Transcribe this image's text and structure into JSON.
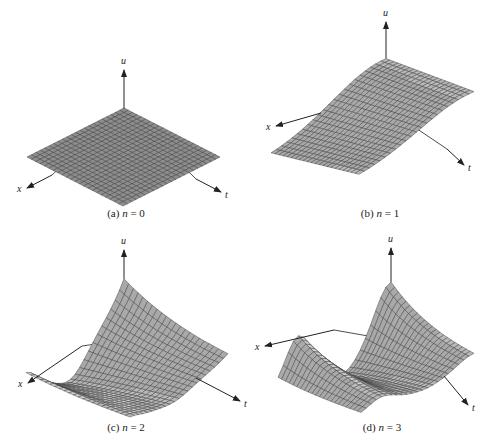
{
  "figure": {
    "panels": [
      {
        "id": "a",
        "caption_prefix": "(a)",
        "caption_var": "n",
        "caption_eq": " = 0",
        "n": 0,
        "axis_labels": {
          "u": "u",
          "x": "x",
          "t": "t"
        },
        "origin": [
          124,
          108
        ],
        "u_tip": [
          124,
          68
        ],
        "x_dir": [
          -97,
          49
        ],
        "t_dir": [
          96,
          49
        ],
        "x_arrow": [
          [
            52,
            175
          ],
          [
            27,
            188
          ]
        ],
        "t_arrow": [
          [
            196,
            179
          ],
          [
            221,
            192
          ]
        ],
        "u_scale": 0,
        "caption_pos": [
          126,
          214
        ]
      },
      {
        "id": "b",
        "caption_prefix": "(b)",
        "caption_var": "n",
        "caption_eq": " = 1",
        "n": 1,
        "axis_labels": {
          "u": "u",
          "x": "x",
          "t": "t"
        },
        "origin": [
          386,
          108
        ],
        "u_tip": [
          386,
          20
        ],
        "x_dir": [
          -115,
          48
        ],
        "t_dir": [
          88,
          20
        ],
        "x_arrow": [
          [
            321,
            113
          ],
          [
            276,
            126
          ]
        ],
        "t_arrow": [
          [
            447,
            149
          ],
          [
            464,
            165
          ]
        ],
        "u_scale": 52,
        "caption_pos": [
          380,
          214
        ]
      },
      {
        "id": "c",
        "caption_prefix": "(c)",
        "caption_var": "n",
        "caption_eq": " = 2",
        "n": 2,
        "axis_labels": {
          "u": "u",
          "x": "x",
          "t": "t"
        },
        "origin": [
          124,
          340
        ],
        "u_tip": [
          124,
          248
        ],
        "x_dir": [
          -98,
          52
        ],
        "t_dir": [
          104,
          30
        ],
        "x_arrow": [
          [
            82,
            346
          ],
          [
            28,
            383
          ]
        ],
        "t_arrow": [
          [
            196,
            378
          ],
          [
            240,
            401
          ]
        ],
        "u_scale": 60,
        "caption_pos": [
          126,
          428
        ]
      },
      {
        "id": "d",
        "caption_prefix": "(d)",
        "caption_var": "n",
        "caption_eq": " = 3",
        "n": 3,
        "axis_labels": {
          "u": "u",
          "x": "x",
          "t": "t"
        },
        "origin": [
          391,
          340
        ],
        "u_tip": [
          391,
          246
        ],
        "x_dir": [
          -113,
          50
        ],
        "t_dir": [
          83,
          25
        ],
        "x_arrow": [
          [
            334,
            330
          ],
          [
            265,
            346
          ]
        ],
        "t_arrow": [
          [
            444,
            376
          ],
          [
            468,
            405
          ]
        ],
        "u_scale": 58,
        "caption_pos": [
          382,
          428
        ]
      }
    ],
    "colors": {
      "surface_fill": "#b9b9b9",
      "surface_fill_dark": "#8e8e8e",
      "grid_line": "#3a3a3a",
      "axis": "#222222",
      "text": "#222222"
    }
  }
}
